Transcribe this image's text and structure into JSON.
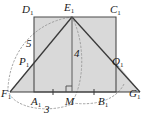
{
  "figure": {
    "type": "geometry-diagram",
    "colors": {
      "stroke": "#3a3a3a",
      "fill": "#d9d9d9",
      "dotted": "#8a8a8a",
      "background": "#ffffff"
    },
    "vertex_labels": [
      {
        "id": "D1",
        "letter": "D",
        "sub": "1",
        "x": 22,
        "y": 4
      },
      {
        "id": "E1",
        "letter": "E",
        "sub": "1",
        "x": 64,
        "y": 2
      },
      {
        "id": "C1",
        "letter": "C",
        "sub": "1",
        "x": 110,
        "y": 4
      },
      {
        "id": "P1",
        "letter": "P",
        "sub": "1",
        "x": 19,
        "y": 57
      },
      {
        "id": "Q1",
        "letter": "Q",
        "sub": "1",
        "x": 112,
        "y": 57
      },
      {
        "id": "F1",
        "letter": "F",
        "sub": "1",
        "x": 2,
        "y": 88
      },
      {
        "id": "A1",
        "letter": "A",
        "sub": "1",
        "x": 32,
        "y": 97
      },
      {
        "id": "M",
        "letter": "M",
        "sub": "",
        "x": 65,
        "y": 97
      },
      {
        "id": "B1",
        "letter": "B",
        "sub": "1",
        "x": 99,
        "y": 97
      },
      {
        "id": "G1",
        "letter": "G",
        "sub": "1",
        "x": 130,
        "y": 88
      }
    ],
    "measure_labels": [
      {
        "id": "side-length-5",
        "value": "5",
        "x": 27,
        "y": 39
      },
      {
        "id": "height-4",
        "value": "4",
        "x": 74,
        "y": 49
      },
      {
        "id": "base-3",
        "value": "3",
        "x": 44,
        "y": 105
      }
    ],
    "geometry": {
      "rect_left": 34,
      "rect_right": 116,
      "rect_top": 17,
      "rect_bottom": 92,
      "apex_x": 72,
      "apex_y": 17,
      "base_left_x": 10,
      "base_right_x": 140,
      "base_y": 92,
      "p_x": 34,
      "p_y": 62,
      "q_x": 116,
      "q_y": 62,
      "mid_x": 72
    },
    "marks": [
      {
        "id": "right-angle-at-M",
        "type": "right-angle"
      },
      {
        "id": "tick-A1-M",
        "type": "equal-tick"
      },
      {
        "id": "tick-M-B1",
        "type": "equal-tick"
      }
    ]
  }
}
